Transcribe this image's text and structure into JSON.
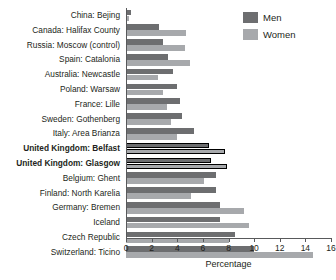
{
  "chart_data": {
    "type": "bar",
    "orientation": "horizontal",
    "title": "",
    "xlabel": "Percentage",
    "ylabel": "",
    "xlim": [
      0,
      16
    ],
    "xticks": [
      0,
      2,
      4,
      6,
      8,
      10,
      12,
      14,
      16
    ],
    "grid": false,
    "legend_position": "top-right",
    "categories": [
      "China: Bejing",
      "Canada: Halifax County",
      "Russia: Moscow (control)",
      "Spain: Catalonia",
      "Australia: Newcastle",
      "Poland: Warsaw",
      "France: Lille",
      "Sweden: Gothenberg",
      "Italy: Area Brianza",
      "United Kingdom: Belfast",
      "United Kingdom: Glasgow",
      "Belgium: Ghent",
      "Finland: North Karelia",
      "Germany: Bremen",
      "Iceland",
      "Czech Republic",
      "Switzerland: Ticino"
    ],
    "highlighted_categories": [
      "United Kingdom: Belfast",
      "United Kingdom: Glasgow"
    ],
    "series": [
      {
        "name": "Men",
        "color": "#6d6e70",
        "values": [
          0.4,
          2.6,
          2.9,
          3.3,
          3.7,
          4.0,
          4.2,
          4.4,
          5.3,
          6.5,
          6.6,
          7.0,
          7.0,
          7.3,
          7.3,
          8.5,
          10.0
        ]
      },
      {
        "name": "Women",
        "color": "#a7a9ac",
        "values": [
          0.2,
          4.7,
          4.6,
          5.0,
          2.5,
          2.9,
          3.2,
          3.5,
          4.0,
          7.7,
          7.9,
          6.1,
          5.1,
          9.2,
          9.6,
          8.0,
          14.6
        ]
      }
    ]
  },
  "legend": {
    "items": [
      {
        "label": "Men",
        "color": "#6d6e70"
      },
      {
        "label": "Women",
        "color": "#a7a9ac"
      }
    ]
  },
  "axis": {
    "x_label": "Percentage",
    "tick_labels": [
      "0",
      "2",
      "4",
      "6",
      "8",
      "10",
      "12",
      "14",
      "16"
    ]
  }
}
